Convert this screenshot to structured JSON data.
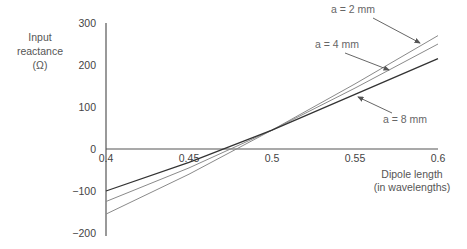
{
  "chart_data": {
    "type": "line",
    "title": "",
    "xlabel": "Dipole length (in wavelengths)",
    "xlabel_lines": [
      "Dipole length",
      "(in wavelengths)"
    ],
    "ylabel": "Input reactance (Ω)",
    "ylabel_lines": [
      "Input",
      "reactance",
      "(Ω)"
    ],
    "xlim": [
      0.4,
      0.6
    ],
    "ylim": [
      -200,
      300
    ],
    "xticks": [
      0.4,
      0.45,
      0.5,
      0.55,
      0.6
    ],
    "xtick_labels": [
      "0.4",
      "0.45",
      "0.5",
      "0.55",
      "0.6"
    ],
    "yticks": [
      300,
      200,
      100,
      0,
      -100,
      -200
    ],
    "ytick_labels": [
      "300",
      "200",
      "100",
      "0",
      "−100",
      "−200"
    ],
    "grid": false,
    "legend": "inline annotations with arrows",
    "x": [
      0.4,
      0.45,
      0.5,
      0.55,
      0.6
    ],
    "series": [
      {
        "name": "a = 2 mm",
        "values": [
          -155,
          -60,
          45,
          155,
          270
        ]
      },
      {
        "name": "a = 4 mm",
        "values": [
          -125,
          -45,
          45,
          145,
          250
        ]
      },
      {
        "name": "a = 8 mm",
        "values": [
          -100,
          -32,
          45,
          130,
          215
        ]
      }
    ],
    "annotations": [
      {
        "text": "a = 2 mm",
        "series": "a = 2 mm"
      },
      {
        "text": "a = 4 mm",
        "series": "a = 4 mm"
      },
      {
        "text": "a = 8 mm",
        "series": "a = 8 mm"
      }
    ]
  }
}
